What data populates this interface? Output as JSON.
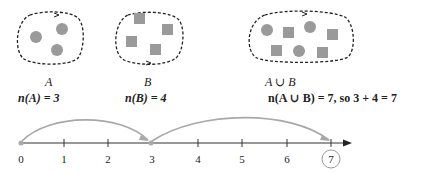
{
  "sets": {
    "A": {
      "label": "A",
      "count_label": "n(A) = 3",
      "shapes": [
        "circle",
        "circle",
        "circle"
      ]
    },
    "B": {
      "label": "B",
      "count_label": "n(B) = 4",
      "shapes": [
        "square",
        "square",
        "square",
        "square"
      ]
    },
    "union": {
      "label": "A ∪ B",
      "count_label": "n(A ∪ B) = 7, so 3 + 4 = 7",
      "shapes": [
        "circle",
        "square",
        "circle",
        "square",
        "square",
        "circle",
        "square"
      ]
    }
  },
  "number_line": {
    "ticks": [
      "0",
      "1",
      "2",
      "3",
      "4",
      "5",
      "6",
      "7"
    ],
    "jumps": [
      {
        "from": 0,
        "to": 3
      },
      {
        "from": 3,
        "to": 7
      }
    ],
    "highlighted_value": "7"
  },
  "colors": {
    "shape_fill": "#9a9a9a",
    "jump_arc": "#a8a8a8",
    "line": "#333333",
    "border": "#222222"
  }
}
